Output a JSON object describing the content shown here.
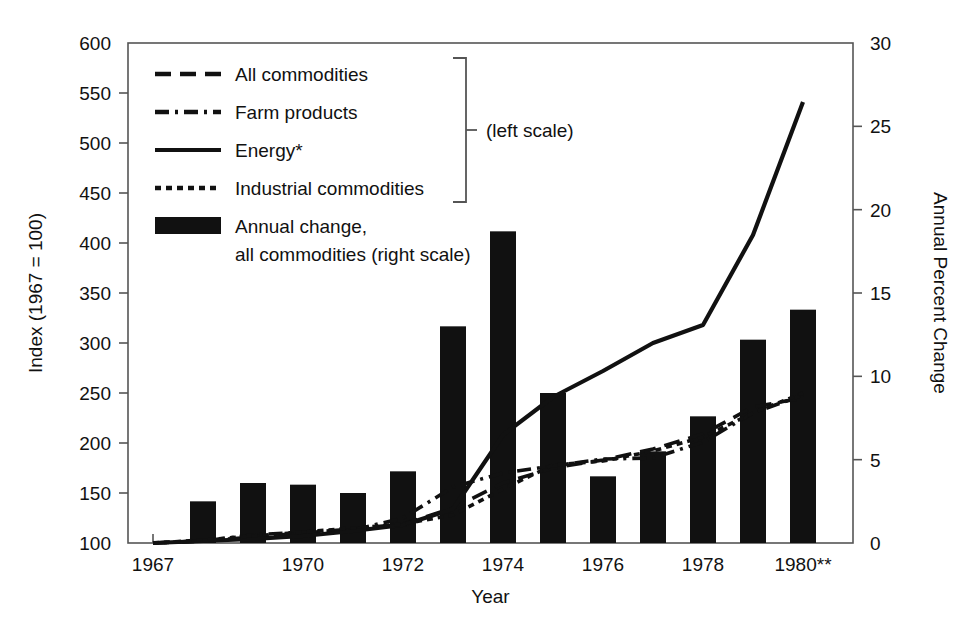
{
  "chart_data": {
    "type": "bar",
    "title": "",
    "xlabel": "Year",
    "ylabel": "Index (1967 = 100)",
    "y2label": "Annual Percent Change",
    "ylim": [
      100,
      600
    ],
    "y2lim": [
      0,
      30
    ],
    "xlim": [
      1966.5,
      1981.0
    ],
    "grid": false,
    "legend_position": "top-left-inside",
    "x": [
      1967,
      1968,
      1969,
      1970,
      1971,
      1972,
      1973,
      1974,
      1975,
      1976,
      1977,
      1978,
      1979,
      1980
    ],
    "x_tick_labels": [
      "1967",
      "1970",
      "1972",
      "1974",
      "1976",
      "1978",
      "1980**"
    ],
    "x_tick_values": [
      1967,
      1970,
      1972,
      1974,
      1976,
      1978,
      1980
    ],
    "y_tick_labels": [
      "100",
      "150",
      "200",
      "250",
      "300",
      "350",
      "400",
      "450",
      "500",
      "550",
      "600"
    ],
    "y_tick_values": [
      100,
      150,
      200,
      250,
      300,
      350,
      400,
      450,
      500,
      550,
      600
    ],
    "y2_tick_labels": [
      "0",
      "5",
      "10",
      "15",
      "20",
      "25",
      "30"
    ],
    "y2_tick_values": [
      0,
      5,
      10,
      15,
      20,
      25,
      30
    ],
    "bars": {
      "name": "Annual change, all commodities",
      "axis": "right",
      "units": "percent",
      "x": [
        1968,
        1969,
        1970,
        1971,
        1972,
        1973,
        1974,
        1975,
        1976,
        1977,
        1978,
        1979,
        1980
      ],
      "values": [
        2.5,
        3.6,
        3.5,
        3.0,
        4.3,
        13.0,
        18.7,
        9.0,
        4.0,
        5.5,
        7.6,
        12.2,
        14.0
      ]
    },
    "series": [
      {
        "name": "All commodities",
        "style": "dashed",
        "axis": "left",
        "x": [
          1967,
          1968,
          1969,
          1970,
          1971,
          1972,
          1973,
          1974,
          1975,
          1976,
          1977,
          1978,
          1979,
          1980
        ],
        "values": [
          100,
          102,
          106,
          110,
          114,
          119,
          135,
          160,
          175,
          183,
          194,
          209,
          236,
          245
        ]
      },
      {
        "name": "Farm products",
        "style": "dash-dot",
        "axis": "left",
        "x": [
          1967,
          1968,
          1969,
          1970,
          1971,
          1972,
          1973,
          1974,
          1975,
          1976,
          1977,
          1978,
          1979,
          1980
        ],
        "values": [
          100,
          102,
          108,
          111,
          113,
          125,
          156,
          170,
          177,
          184,
          185,
          201,
          230,
          248
        ]
      },
      {
        "name": "Energy*",
        "style": "solid",
        "axis": "left",
        "x": [
          1967,
          1968,
          1969,
          1970,
          1971,
          1972,
          1973,
          1974,
          1975,
          1976,
          1977,
          1978,
          1979,
          1980
        ],
        "values": [
          100,
          102,
          104,
          107,
          112,
          118,
          134,
          208,
          246,
          272,
          300,
          318,
          408,
          541
        ]
      },
      {
        "name": "Industrial commodities",
        "style": "dotted",
        "axis": "left",
        "x": [
          1967,
          1968,
          1969,
          1970,
          1971,
          1972,
          1973,
          1974,
          1975,
          1976,
          1977,
          1978,
          1979,
          1980
        ],
        "values": [
          100,
          103,
          107,
          111,
          115,
          119,
          128,
          154,
          178,
          182,
          192,
          206,
          230,
          250
        ]
      }
    ],
    "legend": [
      {
        "label": "All commodities",
        "style": "dashed"
      },
      {
        "label": "Farm products",
        "style": "dash-dot"
      },
      {
        "label": "Energy*",
        "style": "solid"
      },
      {
        "label": "Industrial commodities",
        "style": "dotted"
      },
      {
        "label_line1": "Annual change,",
        "label_line2": "all commodities (right scale)",
        "style": "bar"
      }
    ],
    "annotations": [
      {
        "text": "(left scale)",
        "role": "bracket-note"
      }
    ]
  },
  "labels": {
    "y_axis_title": "Index (1967 = 100)",
    "y2_axis_title": "Annual Percent Change",
    "x_axis_title": "Year",
    "left_scale_note": "(left scale)",
    "legend_all_commodities": "All commodities",
    "legend_farm_products": "Farm products",
    "legend_energy": "Energy*",
    "legend_industrial": "Industrial commodities",
    "legend_bar_line1": "Annual change,",
    "legend_bar_line2": "all commodities (right scale)"
  },
  "colors": {
    "ink": "#111111",
    "bar_fill": "#111111",
    "axis": "#555555",
    "background": "#ffffff"
  }
}
